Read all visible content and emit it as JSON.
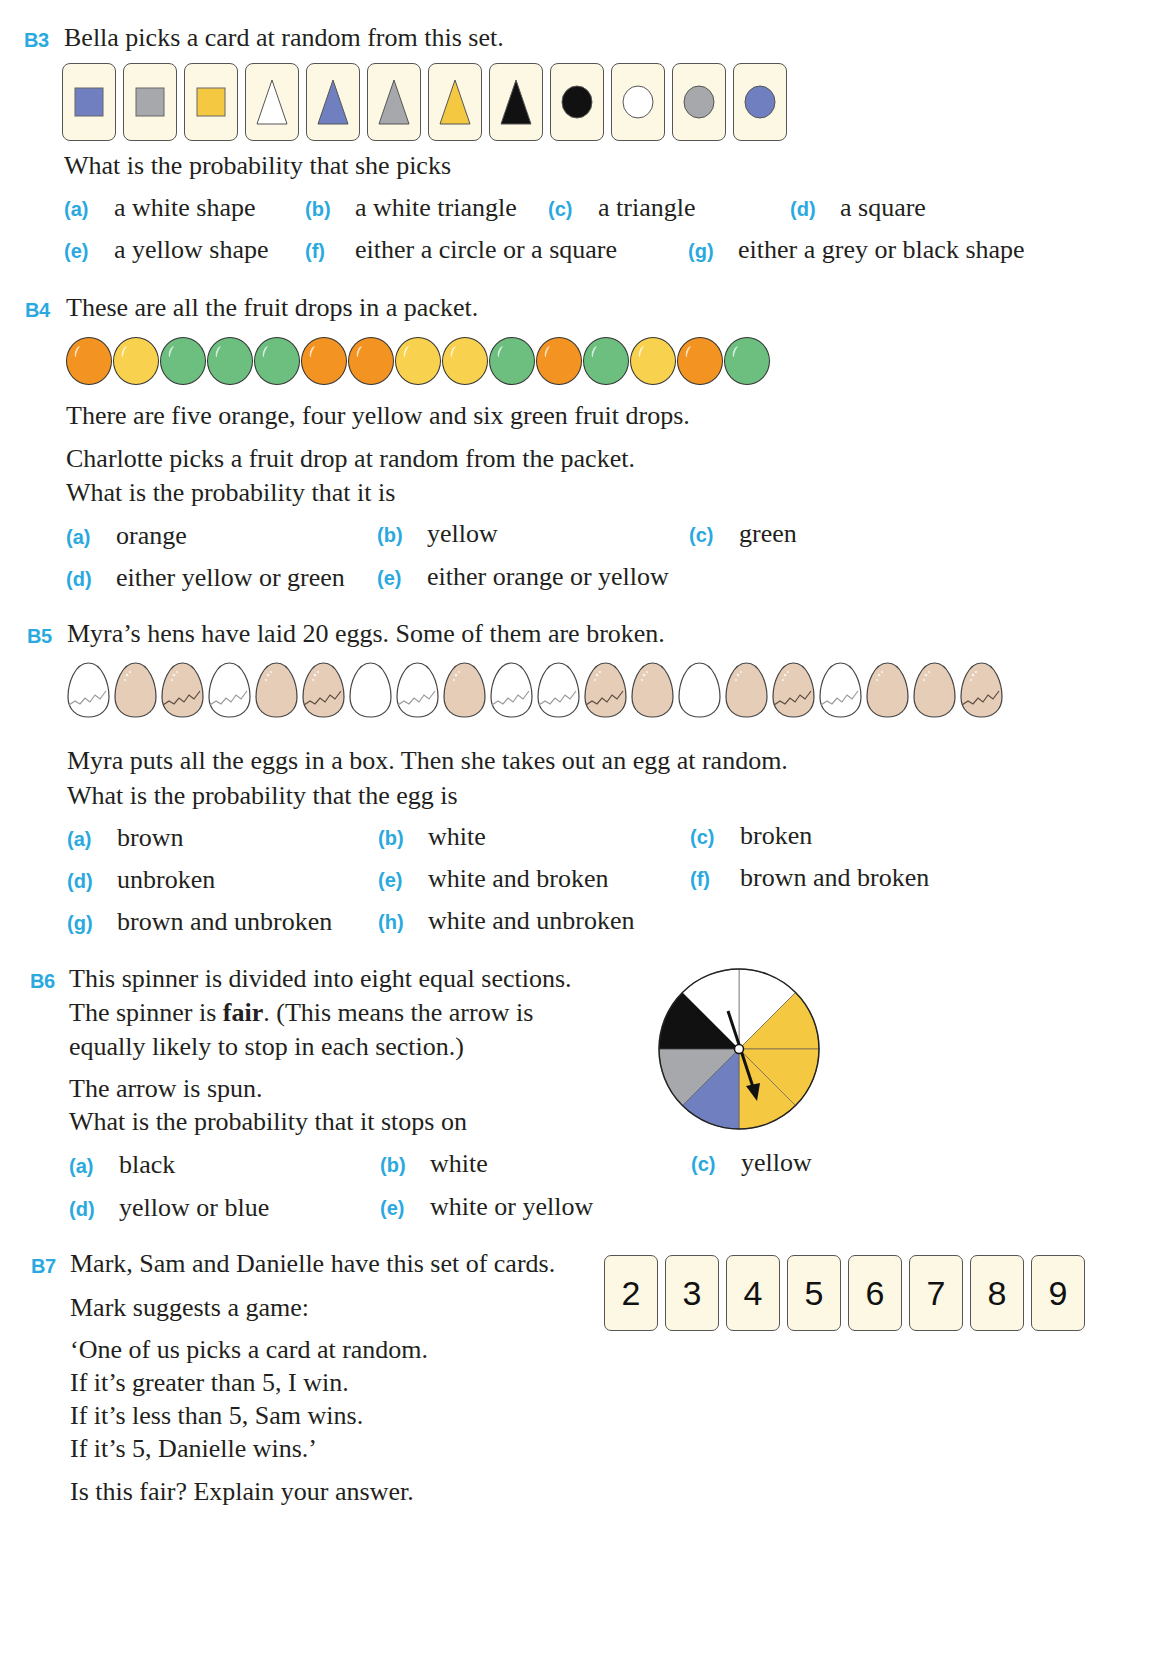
{
  "colors": {
    "accent": "#2aa9df",
    "card_bg": "#fdf8e4",
    "blue": "#6f7fbf",
    "grey": "#a6a8ab",
    "yellow": "#f5c842",
    "white": "#ffffff",
    "black": "#111111",
    "orange": "#f39322",
    "drop_yellow": "#f8d24e",
    "green": "#6cbf7f",
    "egg_brown": "#e6cdb8"
  },
  "b3": {
    "num": "B3",
    "intro": "Bella picks a card at random from this set.",
    "cards": [
      {
        "shape": "square",
        "color": "blue"
      },
      {
        "shape": "square",
        "color": "grey"
      },
      {
        "shape": "square",
        "color": "yellow"
      },
      {
        "shape": "triangle",
        "color": "white"
      },
      {
        "shape": "triangle",
        "color": "blue"
      },
      {
        "shape": "triangle",
        "color": "grey"
      },
      {
        "shape": "triangle",
        "color": "yellow"
      },
      {
        "shape": "triangle",
        "color": "black"
      },
      {
        "shape": "circle",
        "color": "black"
      },
      {
        "shape": "circle",
        "color": "white"
      },
      {
        "shape": "circle",
        "color": "grey"
      },
      {
        "shape": "circle",
        "color": "blue"
      }
    ],
    "question": "What is the probability that she picks",
    "options": [
      {
        "label": "(a)",
        "text": "a white shape"
      },
      {
        "label": "(b)",
        "text": "a white triangle"
      },
      {
        "label": "(c)",
        "text": "a triangle"
      },
      {
        "label": "(d)",
        "text": "a square"
      },
      {
        "label": "(e)",
        "text": "a yellow shape"
      },
      {
        "label": "(f)",
        "text": "either a circle or a square"
      },
      {
        "label": "(g)",
        "text": "either a grey or black shape"
      }
    ]
  },
  "b4": {
    "num": "B4",
    "intro": "These are all the fruit drops in a packet.",
    "drops": [
      "orange",
      "yellow",
      "green",
      "green",
      "green",
      "orange",
      "orange",
      "yellow",
      "yellow",
      "green",
      "orange",
      "green",
      "yellow",
      "orange",
      "green"
    ],
    "line1": "There are five orange, four yellow and six green fruit drops.",
    "line2": "Charlotte picks a fruit drop at random from the packet.",
    "line3": "What is the probability that it is",
    "options": [
      {
        "label": "(a)",
        "text": "orange"
      },
      {
        "label": "(b)",
        "text": "yellow"
      },
      {
        "label": "(c)",
        "text": "green"
      },
      {
        "label": "(d)",
        "text": "either yellow or green"
      },
      {
        "label": "(e)",
        "text": "either orange or yellow"
      }
    ]
  },
  "b5": {
    "num": "B5",
    "intro": "Myra’s hens have laid 20 eggs. Some of them are broken.",
    "eggs": [
      {
        "color": "white",
        "broken": true
      },
      {
        "color": "brown",
        "broken": false
      },
      {
        "color": "brown",
        "broken": true
      },
      {
        "color": "white",
        "broken": true
      },
      {
        "color": "brown",
        "broken": false
      },
      {
        "color": "brown",
        "broken": true
      },
      {
        "color": "white",
        "broken": false
      },
      {
        "color": "white",
        "broken": true
      },
      {
        "color": "brown",
        "broken": false
      },
      {
        "color": "white",
        "broken": true
      },
      {
        "color": "white",
        "broken": true
      },
      {
        "color": "brown",
        "broken": true
      },
      {
        "color": "brown",
        "broken": false
      },
      {
        "color": "white",
        "broken": false
      },
      {
        "color": "brown",
        "broken": false
      },
      {
        "color": "brown",
        "broken": true
      },
      {
        "color": "white",
        "broken": true
      },
      {
        "color": "brown",
        "broken": false
      },
      {
        "color": "brown",
        "broken": false
      },
      {
        "color": "brown",
        "broken": true
      }
    ],
    "line1": "Myra puts all the eggs in a box. Then she takes out an egg at random.",
    "line2": "What is the probability that the egg is",
    "options": [
      {
        "label": "(a)",
        "text": "brown"
      },
      {
        "label": "(b)",
        "text": "white"
      },
      {
        "label": "(c)",
        "text": "broken"
      },
      {
        "label": "(d)",
        "text": "unbroken"
      },
      {
        "label": "(e)",
        "text": "white and broken"
      },
      {
        "label": "(f)",
        "text": "brown and broken"
      },
      {
        "label": "(g)",
        "text": "brown and unbroken"
      },
      {
        "label": "(h)",
        "text": "white and unbroken"
      }
    ]
  },
  "b6": {
    "num": "B6",
    "line1": "This spinner is divided into eight equal sections.",
    "line2a": "The spinner is ",
    "line2b": "fair",
    "line2c": ". (This means the arrow is",
    "line3": "equally likely to stop in each section.)",
    "line4": "The arrow is spun.",
    "line5": "What is the probability that it stops on",
    "spinner_sections": [
      "white",
      "yellow",
      "yellow",
      "yellow",
      "blue",
      "grey",
      "black",
      "white"
    ],
    "options": [
      {
        "label": "(a)",
        "text": "black"
      },
      {
        "label": "(b)",
        "text": "white"
      },
      {
        "label": "(c)",
        "text": "yellow"
      },
      {
        "label": "(d)",
        "text": "yellow or blue"
      },
      {
        "label": "(e)",
        "text": "white or yellow"
      }
    ]
  },
  "b7": {
    "num": "B7",
    "line1": "Mark, Sam and Danielle have this set of cards.",
    "line2": "Mark suggests a game:",
    "line3": "‘One of us picks a card at random.",
    "line4": "If it’s greater than 5, I win.",
    "line5": "If it’s less than 5, Sam wins.",
    "line6": "If it’s 5, Danielle wins.’",
    "line7": "Is this fair? Explain your answer.",
    "cards": [
      "2",
      "3",
      "4",
      "5",
      "6",
      "7",
      "8",
      "9"
    ]
  }
}
